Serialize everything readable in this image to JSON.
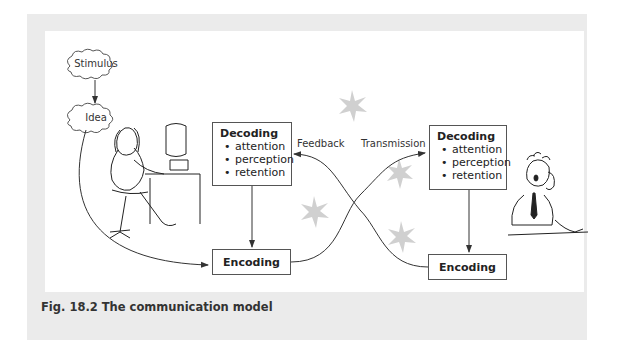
{
  "clouds": {
    "stimulus": "Stimulus",
    "idea": "Idea"
  },
  "sender": {
    "decoding": {
      "title": "Decoding",
      "items": [
        "attention",
        "perception",
        "retention"
      ]
    },
    "encoding": "Encoding"
  },
  "receiver": {
    "decoding": {
      "title": "Decoding",
      "items": [
        "attention",
        "perception",
        "retention"
      ]
    },
    "encoding": "Encoding"
  },
  "arrows": {
    "feedback": "Feedback",
    "transmission": "Transmission"
  },
  "caption": "Fig. 18.2  The communication model",
  "colors": {
    "frame": "#ebebeb",
    "noise_star": "#cfcfcf",
    "line": "#333333"
  }
}
